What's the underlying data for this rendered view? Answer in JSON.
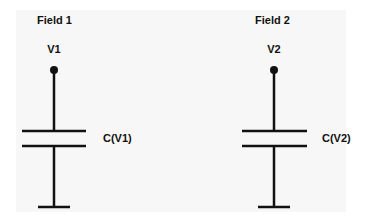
{
  "diagram": {
    "type": "capacitor-schematic",
    "colors": {
      "background": "#ffffff",
      "panel": "#f7f7f7",
      "stroke": "#111111"
    },
    "circuits": [
      {
        "field_title": "Field 1",
        "node_label": "V1",
        "capacitor_label": "C(V1)"
      },
      {
        "field_title": "Field 2",
        "node_label": "V2",
        "capacitor_label": "C(V2)"
      }
    ]
  }
}
